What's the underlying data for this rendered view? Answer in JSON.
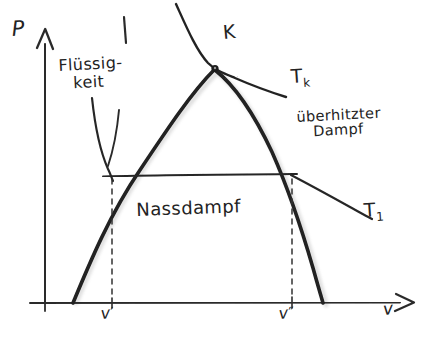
{
  "diagram": {
    "background_color": "#ffffff",
    "ink_color": "#232323",
    "shadow_color": "#c9c9c9",
    "axes": {
      "y_axis_label": "P",
      "x_axis_label": "v",
      "y_axis_arrow": "up-arrow",
      "x_axis_arrow": "right-arrow",
      "origin_px": [
        45,
        303
      ],
      "y_axis_top_px": [
        45,
        30
      ],
      "x_axis_right_px": [
        412,
        303
      ]
    },
    "regions": {
      "liquid": {
        "label_line1": "Flüssig-",
        "label_line2": "keit",
        "position_px": [
          60,
          62
        ]
      },
      "wet_steam": {
        "label": "Nassdampf",
        "position_px": [
          138,
          208
        ]
      },
      "superheated_vapor": {
        "label_line1": "überhitzter",
        "label_line2": "Dampf",
        "position_px": [
          300,
          115
        ]
      }
    },
    "points": {
      "critical_point": {
        "label": "K",
        "marker": "dot",
        "marker_px": [
          215,
          68
        ],
        "label_px": [
          224,
          26
        ]
      }
    },
    "isotherms": [
      {
        "name": "critical-isotherm",
        "label": "T",
        "subscript": "k",
        "label_px": [
          293,
          72
        ]
      },
      {
        "name": "subcritical-isotherm",
        "label": "T",
        "subscript": "1",
        "label_px": [
          366,
          206
        ]
      }
    ],
    "tick_labels": [
      {
        "name": "v-prime",
        "symbol": "v",
        "prime": "′",
        "x_px": 112,
        "label_px": [
          101,
          306
        ]
      },
      {
        "name": "v-double-prime",
        "symbol": "v",
        "prime": "″",
        "x_px": 292,
        "label_px": [
          279,
          306
        ]
      }
    ],
    "strokes": {
      "dome_left_branch": "M 73,303 C 90,262 110,214 140,170 C 168,128 192,92 214,70",
      "dome_right_branch": "M 215,70 C 238,88 256,118 272,152 C 288,188 302,230 313,268 C 318,286 321,296 323,303",
      "critical_isotherm": "M 176,6 C 186,26 196,50 209,64 C 216,71 224,74 236,79 C 252,86 268,92 286,98",
      "sub_isotherm_liquid": "M 92,100 C 95,126 100,150 108,168 C 110,173 111,176 113,180",
      "sub_isotherm_horizontal": "M 104,176 L 296,174",
      "sub_isotherm_vapor": "M 292,176 C 310,186 330,196 348,206 C 358,212 366,216 372,219",
      "liquid_pointer": "M 118,110 C 116,132 112,150 107,165",
      "liquid_tick": "M 124,18 L 126,42",
      "dashed_vprime": "M 112,178 L 112,298",
      "dashed_vdprime": "M 292,178 L 292,298"
    }
  }
}
